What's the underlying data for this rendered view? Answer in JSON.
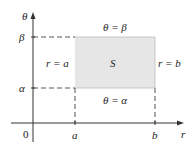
{
  "diagram": {
    "axes": {
      "vertical_label": "θ",
      "horizontal_label": "r",
      "origin_label": "0"
    },
    "ticks": {
      "r": [
        "a",
        "b"
      ],
      "theta": [
        "α",
        "β"
      ]
    },
    "region": {
      "label": "S",
      "fill": "#e6e6e6",
      "top_boundary": "θ = β",
      "bottom_boundary": "θ = α",
      "left_boundary": "r = a",
      "right_boundary": "r = b"
    },
    "colors": {
      "stroke": "#333333",
      "dashes": "#555555"
    }
  }
}
